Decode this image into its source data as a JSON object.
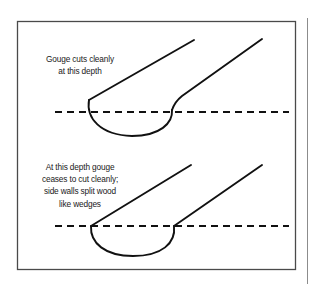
{
  "figure": {
    "name": "gouge-cutting-depth-diagram",
    "background_color": "#ffffff",
    "ink_color": "#111111",
    "frame": {
      "name": "figure-border",
      "x": 17,
      "y": 21,
      "width": 279,
      "height": 249,
      "stroke_color": "#4a4a4a",
      "stroke_width": 1.3
    },
    "right_rule": {
      "name": "page-edge-rule",
      "x": 307,
      "y1": 18,
      "y2": 284,
      "stroke_color": "#8c8c8c",
      "stroke_width": 1
    }
  },
  "captions": {
    "upper": {
      "name": "upper-caption",
      "lines": [
        "Gouge cuts cleanly",
        "at this depth"
      ]
    },
    "lower": {
      "name": "lower-caption",
      "lines": [
        "At this depth gouge",
        "ceases to cut cleanly;",
        "side walls split wood",
        "like wedges"
      ]
    }
  },
  "diagrams": [
    {
      "name": "upper-gouge",
      "label": "Gouge cuts cleanly at this depth",
      "depth_line": {
        "name": "upper-depth-line",
        "y": 112,
        "x_start": 55,
        "x_end": 289,
        "style": "dashed",
        "dash_pattern": "7 5",
        "stroke_width": 1.8
      },
      "bowl": {
        "name": "upper-gouge-bowl",
        "left_x": 89,
        "right_x": 173,
        "bottom_y": 136,
        "top_y": 100
      },
      "left_wall": {
        "name": "upper-left-wall",
        "from": [
          89,
          100
        ],
        "to": [
          194,
          40
        ]
      },
      "right_wall": {
        "name": "upper-right-wall",
        "from": [
          172,
          110
        ],
        "to": [
          262,
          39
        ]
      }
    },
    {
      "name": "lower-gouge",
      "label": "At this depth gouge ceases to cut cleanly; side walls split wood like wedges",
      "depth_line": {
        "name": "lower-depth-line",
        "y": 226,
        "x_start": 55,
        "x_end": 289,
        "style": "dashed",
        "dash_pattern": "7 5",
        "stroke_width": 1.8
      },
      "bowl": {
        "name": "lower-gouge-bowl",
        "left_x": 91,
        "right_x": 175,
        "bottom_y": 256,
        "top_y": 226
      },
      "left_wall": {
        "name": "lower-left-wall",
        "from": [
          91,
          226
        ],
        "to": [
          191,
          165
        ]
      },
      "right_wall": {
        "name": "lower-right-wall",
        "from": [
          174,
          226
        ],
        "to": [
          262,
          165
        ]
      }
    }
  ]
}
